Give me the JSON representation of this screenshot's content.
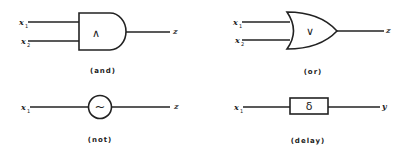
{
  "gates": [
    {
      "id": "and",
      "symbol": "∧",
      "caption": "(and)",
      "inputs": [
        {
          "name": "x",
          "sub": "1"
        },
        {
          "name": "x",
          "sub": "2"
        }
      ],
      "output": "z"
    },
    {
      "id": "or",
      "symbol": "∨",
      "caption": "(or)",
      "inputs": [
        {
          "name": "x",
          "sub": "1"
        },
        {
          "name": "x",
          "sub": "2"
        }
      ],
      "output": "z"
    },
    {
      "id": "not",
      "symbol": "~",
      "caption": "(not)",
      "inputs": [
        {
          "name": "x",
          "sub": "1"
        }
      ],
      "output": "z"
    },
    {
      "id": "delay",
      "symbol": "δ",
      "caption": "(delay)",
      "inputs": [
        {
          "name": "x",
          "sub": "1"
        }
      ],
      "output": "y"
    }
  ]
}
